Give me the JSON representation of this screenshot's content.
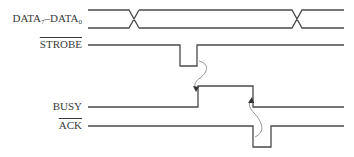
{
  "diagram": {
    "signals": [
      {
        "id": "data",
        "label_main": "DATA",
        "label_sub1": "7",
        "label_sep": "–DATA",
        "label_sub2": "0",
        "active_low": false,
        "type": "bus"
      },
      {
        "id": "strobe",
        "label": "STROBE",
        "active_low": true,
        "type": "pulse-low"
      },
      {
        "id": "busy",
        "label": "BUSY",
        "active_low": false,
        "type": "pulse-high"
      },
      {
        "id": "ack",
        "label": "ACK",
        "active_low": true,
        "type": "pulse-low"
      }
    ],
    "causal_arrows": [
      {
        "from": "STROBE rising edge",
        "to": "BUSY rising edge"
      },
      {
        "from": "ACK falling edge",
        "to": "BUSY falling edge"
      }
    ],
    "colors": {
      "line": "#4a4a4a",
      "arrow": "#888888",
      "text": "#3a3a3a"
    }
  }
}
